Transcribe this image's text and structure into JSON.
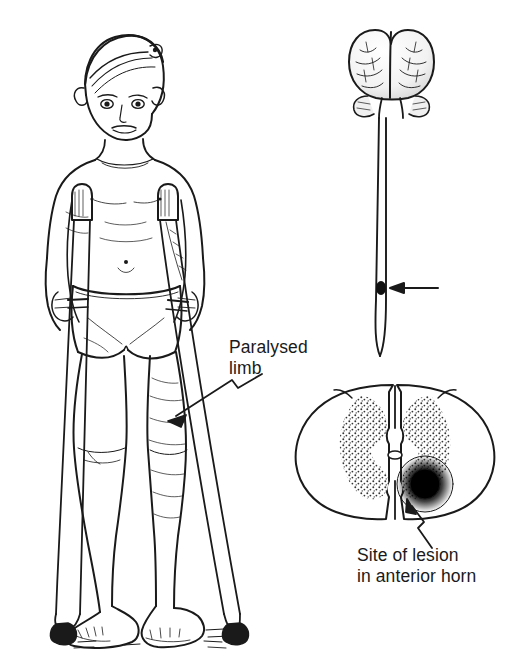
{
  "figure": {
    "kind": "medical-illustration",
    "background_color": "#ffffff",
    "ink_color": "#1a1a1a"
  },
  "labels": {
    "paralysed_limb": "Paralysed\nlimb",
    "site_of_lesion": "Site of lesion\nin anterior horn"
  },
  "panels": {
    "patient": {
      "name": "boy-on-crutches",
      "description": "Standing child using two axillary crutches, bare feet, wearing shorts"
    },
    "neuraxis": {
      "name": "brain-and-spinal-cord",
      "description": "Brain seen from above with spinal cord descending to a tapered conus",
      "marker": "lesion-level-arrow"
    },
    "cross_section": {
      "name": "spinal-cord-cross-section",
      "description": "Transverse section showing stippled butterfly grey matter, central canal, and dark lesion in right anterior horn"
    }
  },
  "markers": {
    "lesion_spot_color": "#111111",
    "grey_matter_stipple_color": "#2a2a2a"
  }
}
